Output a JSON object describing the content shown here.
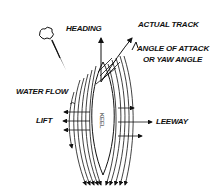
{
  "diagram": {
    "type": "sailing keel hydrodynamics sketch",
    "labels": {
      "heading": "HEADING",
      "actual_track": "ACTUAL TRACK",
      "angle_line1": "ANGLE OF ATTACK",
      "angle_line2": "OR YAW ANGLE",
      "water_flow": "WATER FLOW",
      "lift": "LIFT",
      "leeway": "LEEWAY",
      "keel": "KEEL"
    },
    "icons": {
      "wind": "wind-cloud-icon"
    },
    "colors": {
      "ink": "#111111",
      "background": "#ffffff"
    }
  }
}
